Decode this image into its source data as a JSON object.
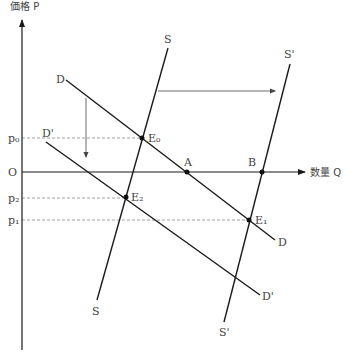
{
  "diagram": {
    "axes": {
      "y_label": "価格 P",
      "x_label": "数量 Q",
      "origin_label": "O"
    },
    "price_levels": [
      {
        "label": "p₀",
        "key": "p0"
      },
      {
        "label": "p₂",
        "key": "p2"
      },
      {
        "label": "p₁",
        "key": "p1"
      }
    ],
    "curves": [
      {
        "name": "D",
        "start_label": "D",
        "end_label": "D",
        "type": "demand"
      },
      {
        "name": "D'",
        "start_label": "D'",
        "end_label": "D'",
        "type": "demand-shifted"
      },
      {
        "name": "S",
        "start_label": "S",
        "end_label": "S",
        "type": "supply"
      },
      {
        "name": "S'",
        "start_label": "S'",
        "end_label": "S'",
        "type": "supply-shifted"
      }
    ],
    "points": [
      {
        "label": "E₀",
        "desc": "intersection S and D"
      },
      {
        "label": "E₁",
        "desc": "intersection S' and D"
      },
      {
        "label": "E₂",
        "desc": "intersection S and D'"
      },
      {
        "label": "A",
        "desc": "D meets Q axis"
      },
      {
        "label": "B",
        "desc": "S' meets Q axis"
      }
    ],
    "shifts": [
      {
        "desc": "supply shift right",
        "from": "S",
        "to": "S'"
      },
      {
        "desc": "demand shift down",
        "from": "D",
        "to": "D'"
      }
    ],
    "colors": {
      "line": "#1a1a1a",
      "dashed": "#888888",
      "text": "#444444"
    }
  }
}
